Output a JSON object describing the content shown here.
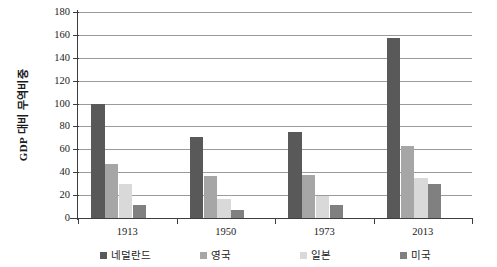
{
  "chart_data": {
    "type": "bar",
    "title": "",
    "xlabel": "",
    "ylabel": "GDP 대비 무역비중",
    "categories": [
      "1913",
      "1950",
      "1973",
      "2013"
    ],
    "series": [
      {
        "name": "네덜란드",
        "color": "#595959",
        "values": [
          100,
          71,
          75,
          157
        ]
      },
      {
        "name": "영국",
        "color": "#a6a6a6",
        "values": [
          47,
          37,
          38,
          63
        ]
      },
      {
        "name": "일본",
        "color": "#d9d9d9",
        "values": [
          30,
          17,
          19,
          35
        ]
      },
      {
        "name": "미국",
        "color": "#808080",
        "values": [
          11,
          7,
          11,
          30
        ]
      }
    ],
    "ylim": [
      0,
      180
    ],
    "ytick_step": 20,
    "yticks": [
      0,
      20,
      40,
      60,
      80,
      100,
      120,
      140,
      160,
      180
    ],
    "ytick_labels": [
      "0",
      "20",
      "40",
      "60",
      "80",
      "100",
      "120",
      "140",
      "160",
      "180"
    ],
    "grid": true,
    "grid_axis": "y",
    "legend_position": "bottom",
    "legend_entries": [
      "네덜란드",
      "영국",
      "일본",
      "미국"
    ],
    "axis_color": "#3d3d3d",
    "gridline_color": "#9b9b9b",
    "background": "#ffffff"
  }
}
